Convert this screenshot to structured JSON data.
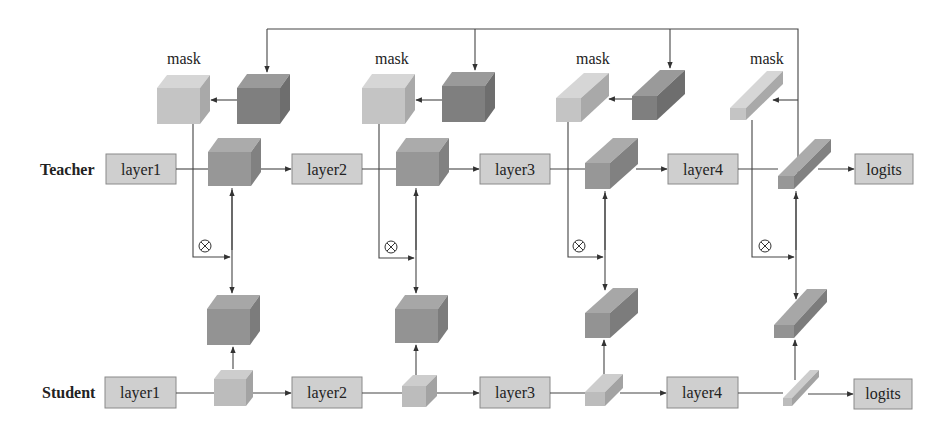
{
  "diagram": {
    "type": "teacher-student feature distillation with masks",
    "rows": {
      "teacher": {
        "label": "Teacher",
        "layers": [
          "layer1",
          "layer2",
          "layer3",
          "layer4"
        ],
        "output": "logits"
      },
      "student": {
        "label": "Student",
        "layers": [
          "layer1",
          "layer2",
          "layer3",
          "layer4"
        ],
        "output": "logits"
      }
    },
    "mask_label": "mask",
    "masks": [
      {
        "label": "mask",
        "stage": 1
      },
      {
        "label": "mask",
        "stage": 2
      },
      {
        "label": "mask",
        "stage": 3
      },
      {
        "label": "mask",
        "stage": 4
      }
    ],
    "operator_symbol": "⊗",
    "colors": {
      "box_fill": "#cfcfcf",
      "mask_light": "#c6c6c6",
      "mask_dark": "#7d7d7d",
      "teacher_feature": "#999999",
      "student_feature": "#bdbdbd",
      "line": "#444444"
    }
  }
}
